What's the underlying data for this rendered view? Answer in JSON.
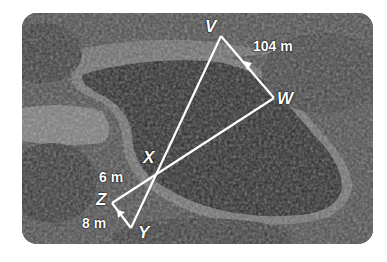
{
  "figure": {
    "vertices": {
      "V": "V",
      "W": "W",
      "X": "X",
      "Y": "Y",
      "Z": "Z"
    },
    "measurements": {
      "VW": "104 m",
      "XZ": "6 m",
      "ZY": "8 m"
    },
    "colors": {
      "lines": "#ffffff",
      "photo_tone": "grayscale"
    }
  }
}
